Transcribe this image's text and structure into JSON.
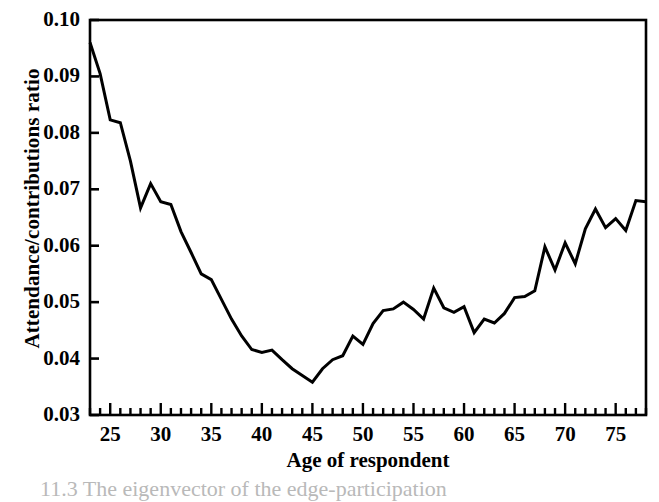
{
  "figure": {
    "caption_partial": "11.3  The eigenvector of the edge-participation"
  },
  "chart_data": {
    "type": "line",
    "title": "",
    "xlabel": "Age of respondent",
    "ylabel": "Attendance/contributions ratio",
    "xlim": [
      23,
      78
    ],
    "ylim": [
      0.03,
      0.1
    ],
    "grid": false,
    "legend": "none",
    "x_major_ticks": [
      25,
      30,
      35,
      40,
      45,
      50,
      55,
      60,
      65,
      70,
      75
    ],
    "x_major_tick_labels": [
      "25",
      "30",
      "35",
      "40",
      "45",
      "50",
      "55",
      "60",
      "65",
      "70",
      "75"
    ],
    "x_minor_tick_step": 1,
    "y_ticks": [
      0.03,
      0.04,
      0.05,
      0.06,
      0.07,
      0.08,
      0.09,
      0.1
    ],
    "y_tick_labels": [
      "0.03",
      "0.04",
      "0.05",
      "0.06",
      "0.07",
      "0.08",
      "0.09",
      "0.10"
    ],
    "line_color": "#000000",
    "line_width": 3,
    "series": [
      {
        "name": "Attendance/contributions ratio by age",
        "x": [
          23,
          24,
          25,
          26,
          27,
          28,
          29,
          30,
          31,
          32,
          33,
          34,
          35,
          36,
          37,
          38,
          39,
          40,
          41,
          42,
          43,
          44,
          45,
          46,
          47,
          48,
          49,
          50,
          51,
          52,
          53,
          54,
          55,
          56,
          57,
          58,
          59,
          60,
          61,
          62,
          63,
          64,
          65,
          66,
          67,
          68,
          69,
          70,
          71,
          72,
          73,
          74,
          75,
          76,
          77,
          78
        ],
        "values": [
          0.096,
          0.0905,
          0.0823,
          0.0818,
          0.075,
          0.0667,
          0.071,
          0.0678,
          0.0673,
          0.0625,
          0.0588,
          0.055,
          0.054,
          0.0505,
          0.047,
          0.044,
          0.0416,
          0.0411,
          0.0415,
          0.0398,
          0.0382,
          0.037,
          0.0358,
          0.0382,
          0.0398,
          0.0405,
          0.044,
          0.0425,
          0.0462,
          0.0485,
          0.0488,
          0.05,
          0.0487,
          0.047,
          0.0525,
          0.049,
          0.0482,
          0.0492,
          0.0446,
          0.047,
          0.0463,
          0.048,
          0.0508,
          0.051,
          0.052,
          0.0598,
          0.0557,
          0.0605,
          0.0568,
          0.063,
          0.0665,
          0.0632,
          0.0648,
          0.0627,
          0.068,
          0.0678
        ]
      }
    ],
    "annotations": {
      "minimum": {
        "x": 45,
        "y": 0.0358
      },
      "start": {
        "x": 23,
        "y": 0.096
      },
      "end": {
        "x": 78,
        "y": 0.0678
      }
    }
  }
}
